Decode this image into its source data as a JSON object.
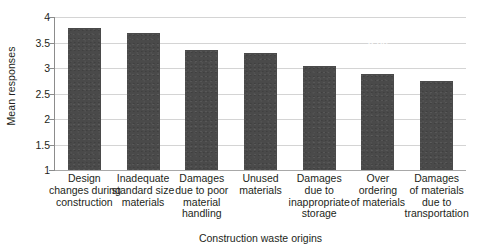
{
  "chart_data": {
    "type": "bar",
    "title": "",
    "xlabel": "Construction waste origins",
    "ylabel": "Mean responses",
    "ylim": [
      1,
      4
    ],
    "yticks": [
      "1",
      "1.5",
      "2",
      "2.5",
      "3",
      "3.5",
      "4"
    ],
    "ytick_values": [
      1,
      1.5,
      2,
      2.5,
      3,
      3.5,
      4
    ],
    "grid": true,
    "legend": "none",
    "orientation": "vertical",
    "bar_color": "#4a4a4a",
    "value_label_color": "#ffffff",
    "gridline_color": "#d4d4d4",
    "axis_color": "#8c8c8c",
    "background": "#ffffff",
    "categories": [
      "Design changes during construction",
      "Inadequate standard size materials",
      "Damages due to poor material handling",
      "Unused materials",
      "Damages due to inappropriate storage",
      "Over ordering of materials",
      "Damages of materials due to transportation"
    ],
    "category_lines": [
      [
        "Design",
        "changes during",
        "construction"
      ],
      [
        "Inadequate",
        "standard size",
        "materials"
      ],
      [
        "Damages",
        "due to poor",
        "material",
        "handling"
      ],
      [
        "Unused",
        "materials"
      ],
      [
        "Damages",
        "due to",
        "inappropriate",
        "storage"
      ],
      [
        "Over",
        "ordering",
        "of materials"
      ],
      [
        "Damages",
        "of materials",
        "due to",
        "transportation"
      ]
    ],
    "values": [
      3.79,
      3.69,
      3.36,
      3.3,
      3.04,
      2.89,
      2.74
    ],
    "value_labels": [
      "3.79",
      "3.69",
      "3.36",
      "3.3",
      "3.04",
      "2.89",
      "2.74"
    ]
  }
}
